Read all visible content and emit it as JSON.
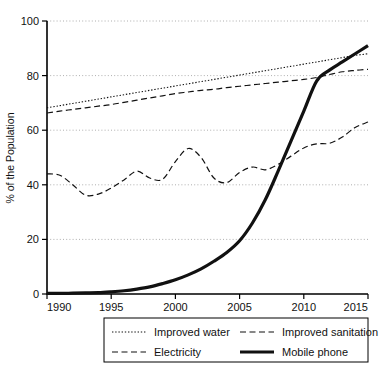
{
  "chart_data": {
    "type": "line",
    "title": "",
    "xlabel": "",
    "ylabel": "% of the Population",
    "xlim": [
      1990,
      2015
    ],
    "ylim": [
      0,
      100
    ],
    "grid": true,
    "legend_position": "bottom",
    "xticks": [
      "1990",
      "1995",
      "2000",
      "2005",
      "2010",
      "2015"
    ],
    "xtick_values": [
      1990,
      1995,
      2000,
      2005,
      2010,
      2015
    ],
    "yticks": [
      "0",
      "20",
      "40",
      "60",
      "80",
      "100"
    ],
    "ytick_values": [
      0,
      20,
      40,
      60,
      80,
      100
    ],
    "x": [
      1990,
      1991,
      1992,
      1993,
      1994,
      1995,
      1996,
      1997,
      1998,
      1999,
      2000,
      2001,
      2002,
      2003,
      2004,
      2005,
      2006,
      2007,
      2008,
      2009,
      2010,
      2011,
      2012,
      2013,
      2014,
      2015
    ],
    "series": [
      {
        "name": "Improved water",
        "style": "dotted",
        "values": [
          68.2,
          69.0,
          69.8,
          70.6,
          71.4,
          72.2,
          73.0,
          73.8,
          74.6,
          75.4,
          76.2,
          77.0,
          77.8,
          78.6,
          79.4,
          80.2,
          81.0,
          81.8,
          82.6,
          83.4,
          84.2,
          85.0,
          85.8,
          86.6,
          87.4,
          88.0
        ]
      },
      {
        "name": "Improved sanitation",
        "style": "dashed",
        "values": [
          66.3,
          67.0,
          67.6,
          68.2,
          68.8,
          69.4,
          70.2,
          71.0,
          71.8,
          72.6,
          73.4,
          74.0,
          74.6,
          75.0,
          75.6,
          76.1,
          76.6,
          77.1,
          77.6,
          78.1,
          78.6,
          79.3,
          80.4,
          81.4,
          81.9,
          82.3
        ]
      },
      {
        "name": "Electricity",
        "style": "dashed",
        "values": [
          44.0,
          43.5,
          40.0,
          36.2,
          36.6,
          38.8,
          41.8,
          45.0,
          42.5,
          42.0,
          48.5,
          53.3,
          50.0,
          42.5,
          40.8,
          44.5,
          46.5,
          45.5,
          47.5,
          50.5,
          53.5,
          55.0,
          55.2,
          57.5,
          61.0,
          63.0
        ]
      },
      {
        "name": "Mobile phone",
        "style": "solid",
        "values": [
          0.2,
          0.2,
          0.3,
          0.4,
          0.5,
          0.8,
          1.2,
          1.8,
          2.6,
          3.8,
          5.2,
          7.0,
          9.2,
          12.0,
          15.2,
          19.5,
          26.0,
          34.5,
          45.0,
          56.0,
          67.0,
          78.0,
          82.0,
          85.0,
          88.0,
          91.0
        ]
      }
    ]
  },
  "legend": {
    "items": [
      {
        "label": "Improved water",
        "style": "dotted"
      },
      {
        "label": "Improved sanitation",
        "style": "dashed"
      },
      {
        "label": "Electricity",
        "style": "dashed"
      },
      {
        "label": "Mobile phone",
        "style": "solid"
      }
    ]
  },
  "colors": {
    "line": "#111111",
    "grid": "#9a9a9a",
    "axis": "#000000",
    "background": "#ffffff"
  }
}
